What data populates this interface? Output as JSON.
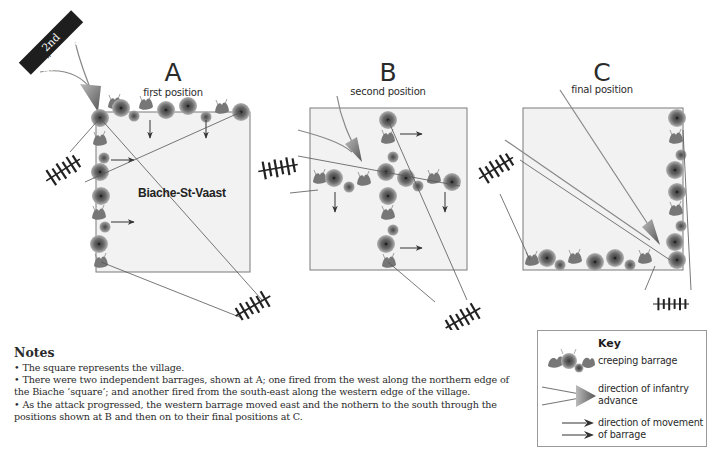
{
  "unit": {
    "name": "2nd Middlesex",
    "symbol": "II"
  },
  "panels": [
    {
      "letter": "A",
      "caption": "first position",
      "village_label": "Biache-St-Vaast",
      "box": {
        "x": 96,
        "y": 112,
        "w": 154,
        "h": 160
      }
    },
    {
      "letter": "B",
      "caption": "second position",
      "box": {
        "x": 310,
        "y": 108,
        "w": 157,
        "h": 162
      }
    },
    {
      "letter": "C",
      "caption": "final position",
      "box": {
        "x": 523,
        "y": 108,
        "w": 160,
        "h": 162
      }
    }
  ],
  "notes": {
    "title": "Notes",
    "items": [
      "• The square represents the village.",
      "• There were two independent barrages, shown at A; one fired from the west along the northern edge of the Biache ‘square’; and another fired from the south-east along the western edge of the village.",
      "• As the attack progressed, the western barrage moved east and the nothern to the south through the positions shown at B and then on to their final positions at C."
    ]
  },
  "key": {
    "title": "Key",
    "entries": [
      {
        "icon": "creeping-barrage-icon",
        "label": "creeping barrage"
      },
      {
        "icon": "infantry-advance-arrow-icon",
        "label": "direction of infantry advance"
      },
      {
        "icon": "barrage-movement-arrow-icon",
        "label": "direction of movement of barrage"
      }
    ]
  },
  "colors": {
    "village_fill": "#f2f2f2",
    "village_border": "#7a7a7a",
    "barrage_dark": "#4a4a4a",
    "barrage_light": "#9a9a9a",
    "line": "#555555",
    "arrow": "#333333",
    "unit_box": "#1e1e1e"
  }
}
